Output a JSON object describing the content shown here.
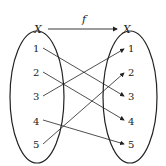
{
  "diagram": {
    "domain_set": "X",
    "codomain_set": "X",
    "function_label": "f",
    "left_elements": [
      "1",
      "2",
      "3",
      "4",
      "5"
    ],
    "right_elements": [
      "1",
      "2",
      "3",
      "4",
      "5"
    ],
    "mapping": [
      {
        "from": "1",
        "to": "3"
      },
      {
        "from": "2",
        "to": "4"
      },
      {
        "from": "3",
        "to": "1"
      },
      {
        "from": "4",
        "to": "5"
      },
      {
        "from": "5",
        "to": "2"
      }
    ],
    "colors": {
      "stroke": "#222222",
      "background": "#ffffff"
    }
  }
}
